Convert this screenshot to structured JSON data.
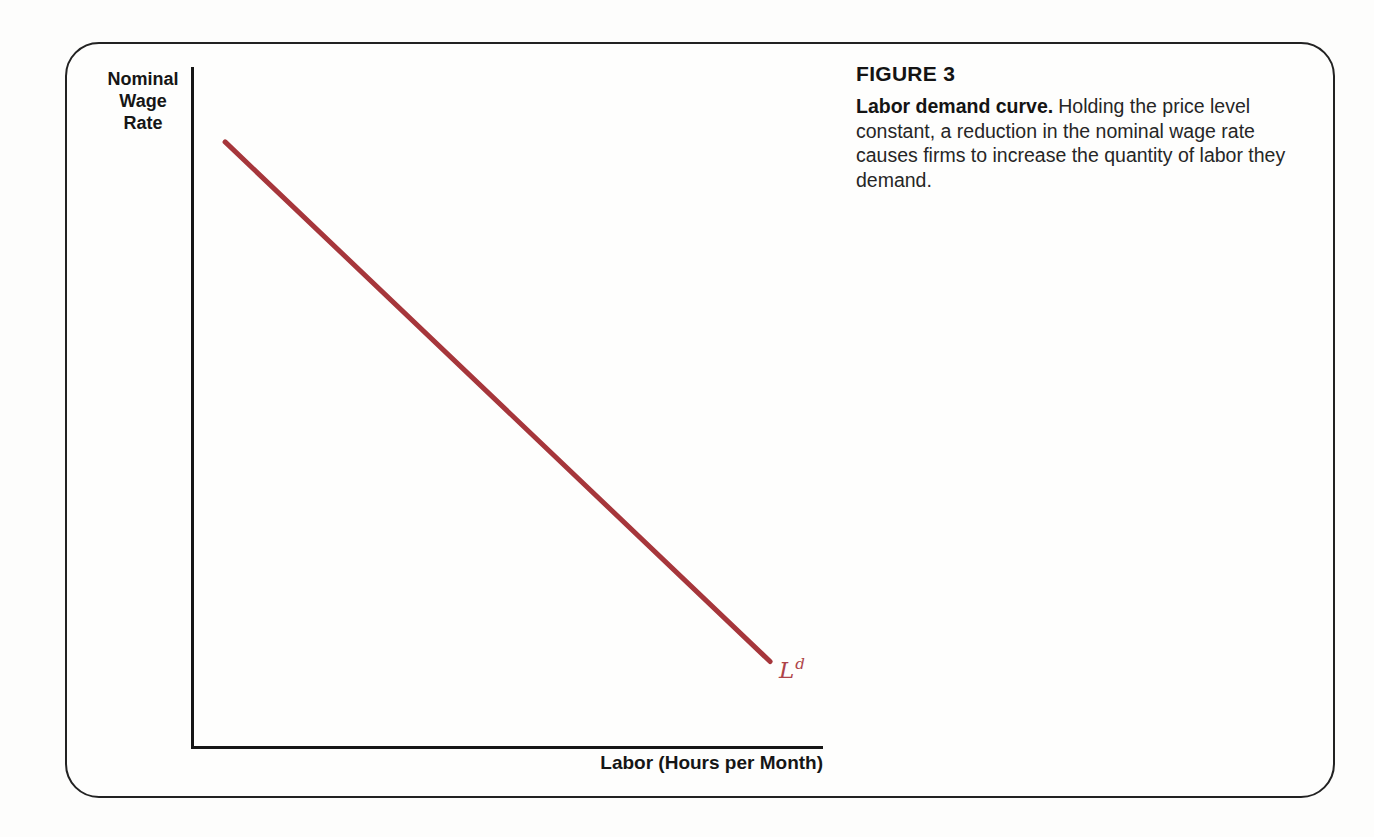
{
  "figure": {
    "heading": "FIGURE 3",
    "caption_lead": "Labor demand curve.",
    "caption_body": "Holding the price level constant, a reduction in the nominal wage rate causes firms to increase the quantity of labor they demand.",
    "ylabel_lines": [
      "Nominal",
      "Wage",
      "Rate"
    ],
    "xlabel": "Labor (Hours per Month)",
    "curve_label_base": "L",
    "curve_label_sup": "d",
    "colors": {
      "curve": "#a6363b",
      "curve_label": "#ae4449",
      "axis": "#161616",
      "frame_border": "#222222",
      "text": "#1e1e1e",
      "page_background": "#fdfdfc"
    }
  },
  "chart_data": {
    "type": "line",
    "title": "Labor demand curve",
    "xlabel": "Labor (Hours per Month)",
    "ylabel": "Nominal Wage Rate",
    "axes_numeric": false,
    "grid": false,
    "legend_position": "none",
    "series": [
      {
        "name": "Labor demand curve (Ld)",
        "label": "Ld",
        "color": "#a6363b",
        "stroke_width": 5,
        "x_frac": [
          0.051,
          0.916
        ],
        "y_frac": [
          0.89,
          0.127
        ]
      }
    ],
    "annotations": [
      {
        "text": "Ld",
        "position": "lower-right end of curve",
        "color": "#ae4449",
        "style": "italic, d superscripted"
      }
    ]
  }
}
